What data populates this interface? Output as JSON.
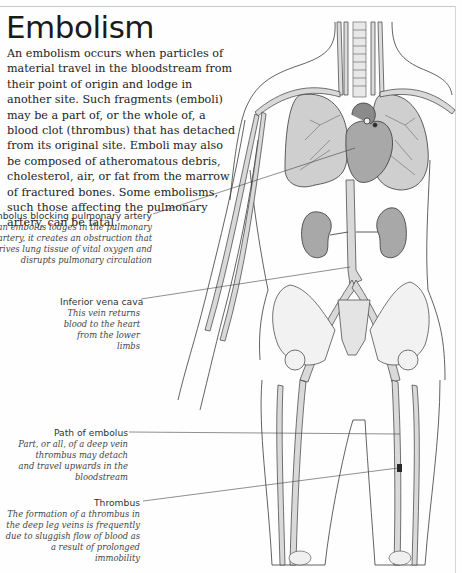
{
  "page": {
    "title": "Embolism",
    "intro": "An embolism occurs when particles of material travel in the bloodstream from their point of origin and lodge in another site. Such fragments (emboli) may be a part of, or the whole of, a blood clot (thrombus) that has detached from its original site. Emboli may also be composed of atheromatous debris, cholesterol, air, or fat from the marrow of fractured bones. Some embolisms, such those affecting the pulmonary artery, can be fatal."
  },
  "illustration": {
    "subject": "human-circulatory-system-anatomy",
    "colors": {
      "vessel_fill": "#d9d9d9",
      "organ_fill": "#b8b8b8",
      "line": "#3a3a3a",
      "thrombus": "#2a2a2a"
    }
  },
  "callouts": [
    {
      "label": "Embolus blocking pulmonary artery",
      "description": "If an embolus lodges in the pulmonary artery, it creates an obstruction that deprives lung tissue of vital oxygen and disrupts pulmonary circulation"
    },
    {
      "label": "Inferior vena cava",
      "description": "This vein returns blood to the heart from the lower limbs"
    },
    {
      "label": "Path of embolus",
      "description": "Part, or all, of a deep vein thrombus may detach and travel upwards in the bloodstream"
    },
    {
      "label": "Thrombus",
      "description": "The formation of a thrombus in the deep leg veins is frequently due to sluggish flow of blood as a result of prolonged immobility"
    }
  ]
}
